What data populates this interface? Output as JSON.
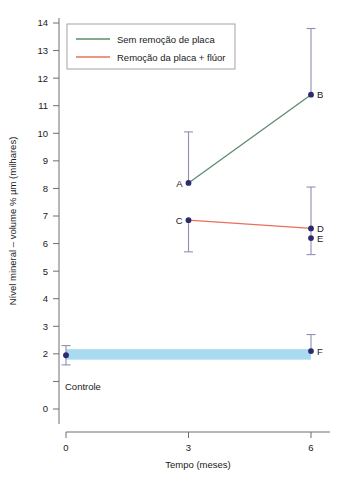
{
  "chart_data": {
    "type": "scatter",
    "title": "",
    "xlabel": "Tempo (meses)",
    "ylabel": "Nível mineral – volume % µm (milhares)",
    "xlim": [
      0,
      6
    ],
    "ylim": [
      0,
      14
    ],
    "xticks": [
      "0",
      "3",
      "6"
    ],
    "xtick_values": [
      0,
      3,
      6
    ],
    "yticks": [
      "0",
      "2",
      "3",
      "4",
      "5",
      "6",
      "7",
      "8",
      "9",
      "10",
      "11",
      "12",
      "13",
      "14"
    ],
    "ytick_values": [
      0,
      2,
      3,
      4,
      5,
      6,
      7,
      8,
      9,
      10,
      11,
      12,
      13,
      14
    ],
    "grid": false,
    "legend_position": "top-left",
    "legend": [
      {
        "key": "sem_remocao",
        "label": "Sem remoção de placa",
        "color": "#5b8c6e"
      },
      {
        "key": "remocao_fluor",
        "label": "Remoção da placa + flúor",
        "color": "#e8705a"
      }
    ],
    "series": [
      {
        "name": "Sem remoção de placa",
        "color": "#5b8c6e",
        "x": [
          3,
          6
        ],
        "values": [
          8.2,
          11.4
        ]
      },
      {
        "name": "Remoção da placa + flúor",
        "color": "#e8705a",
        "x": [
          3,
          6
        ],
        "values": [
          6.85,
          6.55
        ]
      }
    ],
    "points": [
      {
        "id": "ctrl",
        "label": "",
        "x": 0,
        "y": 1.95,
        "err_low": 1.6,
        "err_high": 2.3,
        "series": "controle"
      },
      {
        "id": "A",
        "label": "A",
        "x": 3,
        "y": 8.2,
        "err_low": 8.2,
        "err_high": 10.05,
        "series": "sem_remocao",
        "label_side": "left"
      },
      {
        "id": "B",
        "label": "B",
        "x": 6,
        "y": 11.4,
        "err_low": 11.4,
        "err_high": 13.8,
        "series": "sem_remocao",
        "label_side": "right"
      },
      {
        "id": "C",
        "label": "C",
        "x": 3,
        "y": 6.85,
        "err_low": 5.7,
        "err_high": 6.85,
        "series": "remocao_fluor",
        "label_side": "left"
      },
      {
        "id": "D",
        "label": "D",
        "x": 6,
        "y": 6.55,
        "err_low": 5.6,
        "err_high": 8.05,
        "series": "remocao_fluor",
        "label_side": "right"
      },
      {
        "id": "E",
        "label": "E",
        "x": 6,
        "y": 6.2,
        "series": "controle_6",
        "label_side": "right"
      },
      {
        "id": "F",
        "label": "F",
        "x": 6,
        "y": 2.1,
        "err_low": 2.1,
        "err_high": 2.7,
        "series": "controle_band",
        "label_side": "right"
      }
    ],
    "control_band": {
      "label": "Controle",
      "color": "#a8daf0",
      "y_center": 1.98,
      "thickness": 0.38,
      "x_start": 0,
      "x_end": 6
    },
    "marker_color": "#2b2b6e",
    "errorbar_color": "#8f8fb5",
    "axis_color": "#6e6e6e"
  }
}
